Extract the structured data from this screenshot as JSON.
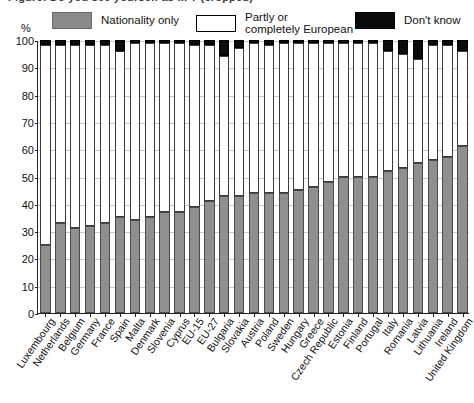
{
  "title_cropped": "Figure: Do you see yourself as ... ? (cropped)",
  "axis": {
    "unit_label": "%",
    "y_ticks": [
      0,
      10,
      20,
      30,
      40,
      50,
      60,
      70,
      80,
      90,
      100
    ]
  },
  "legend": {
    "items": [
      {
        "id": "nationality-only",
        "label": "Nationality only",
        "color": "#8f8f8f",
        "swatch": "sw-gray"
      },
      {
        "id": "partly-or-completely-european",
        "label": "Partly or\ncompletely European",
        "color": "#ffffff",
        "swatch": "sw-white"
      },
      {
        "id": "dont-know",
        "label": "Don't know",
        "color": "#0b0b0b",
        "swatch": "sw-black"
      }
    ]
  },
  "chart_data": {
    "type": "bar",
    "subtype": "stacked-100-percent",
    "title": "",
    "xlabel": "",
    "ylabel": "%",
    "ylim": [
      0,
      100
    ],
    "grid": true,
    "legend_position": "top",
    "categories": [
      "Luxembourg",
      "Netherlands",
      "Belgium",
      "Germany",
      "France",
      "Spain",
      "Malta",
      "Denmark",
      "Slovenia",
      "Cyprus",
      "EU-15",
      "EU-27",
      "Bulgaria",
      "Slovakia",
      "Austria",
      "Poland",
      "Sweden",
      "Hungary",
      "Greece",
      "Czech Republic",
      "Estonia",
      "Finland",
      "Portugal",
      "Italy",
      "Romania",
      "Latvia",
      "Lithuania",
      "Ireland",
      "United Kingdom"
    ],
    "series": [
      {
        "name": "Nationality only",
        "color": "#8f8f8f",
        "values": [
          25,
          33,
          31,
          32,
          33,
          35,
          34,
          35,
          37,
          37,
          39,
          41,
          43,
          43,
          44,
          44,
          44,
          45,
          46,
          48,
          50,
          50,
          50,
          52,
          53,
          55,
          56,
          57,
          61
        ]
      },
      {
        "name": "Partly or completely European",
        "color": "#ffffff",
        "values": [
          73,
          65,
          67,
          66,
          65,
          61,
          65,
          64,
          62,
          62,
          59,
          57,
          51,
          54,
          55,
          54,
          55,
          54,
          53,
          51,
          49,
          49,
          49,
          44,
          42,
          38,
          42,
          41,
          35
        ]
      },
      {
        "name": "Don't know",
        "color": "#0b0b0b",
        "values": [
          2,
          2,
          2,
          2,
          2,
          4,
          1,
          1,
          1,
          1,
          2,
          2,
          6,
          3,
          1,
          2,
          1,
          1,
          1,
          1,
          1,
          1,
          1,
          4,
          5,
          7,
          2,
          2,
          4
        ]
      }
    ]
  }
}
